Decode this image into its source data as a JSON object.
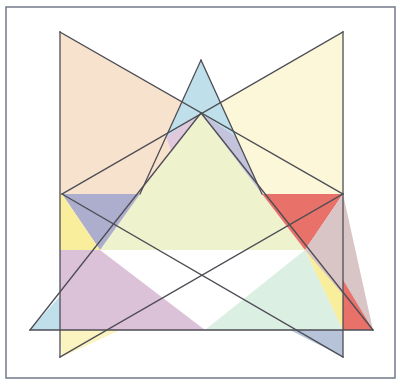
{
  "canvas": {
    "width": 404,
    "height": 387,
    "background": "#ffffff",
    "title": "Overlapping Translucent Triangles"
  },
  "frame": {
    "name": "border-frame",
    "x": 6,
    "y": 7,
    "width": 389,
    "height": 371,
    "stroke": "#7b8190",
    "stroke_width": 1.6,
    "fill": "#ffffff"
  },
  "style": {
    "outline_stroke": "#4d4d55",
    "outline_width": 1.3,
    "blend_mode": "multiply",
    "fill_opacity": 1
  },
  "palette": {
    "peach": "#f7e2cd",
    "pale_yellow": "#fbf7d8",
    "sky_blue": "#bfe0ea",
    "soft_green": "#e9f2cf",
    "mauve": "#dcc2d8",
    "blue_gray": "#adaece",
    "red": "#e8716a",
    "warm_yellow": "#f8ee9c",
    "mint": "#dcefe3",
    "rose_gray": "#d9c5c5"
  },
  "chart_data": {
    "type": "diagram",
    "subtype": "overlapping-triangles",
    "coordinate_space": {
      "x": [
        0,
        404
      ],
      "y": [
        0,
        387
      ],
      "origin": "top-left"
    },
    "shapes": [
      {
        "id": "triangle-peach",
        "label": "Peach left wedge",
        "fill": "#f7e2cd",
        "vertices": [
          [
            60,
            32
          ],
          [
            343,
            194
          ],
          [
            60,
            357
          ]
        ]
      },
      {
        "id": "triangle-pale-yellow",
        "label": "Pale yellow right wedge",
        "fill": "#fbf7d8",
        "vertices": [
          [
            343,
            32
          ],
          [
            62,
            194
          ],
          [
            343,
            357
          ]
        ]
      },
      {
        "id": "triangle-sky-blue",
        "label": "Sky blue narrow spire",
        "fill": "#bfe0ea",
        "vertices": [
          [
            201,
            60
          ],
          [
            262,
            194
          ],
          [
            140,
            194
          ]
        ]
      },
      {
        "id": "triangle-green-base",
        "label": "Soft green broad triangle",
        "fill": "#e9f2cf",
        "vertices": [
          [
            201,
            113
          ],
          [
            373,
            330
          ],
          [
            30,
            330
          ]
        ]
      }
    ],
    "overlap_regions": [
      {
        "label": "peach x pale-yellow upper",
        "tint": "#e8d4e0"
      },
      {
        "label": "peach x green left",
        "tint": "#adaece"
      },
      {
        "label": "pale-yellow x green center",
        "tint": "#eef3cd"
      },
      {
        "label": "green x peach lower",
        "tint": "#dcc2d8"
      },
      {
        "label": "pale-yellow outside green right",
        "tint": "#e8716a"
      },
      {
        "label": "warm yellow right lower",
        "tint": "#f8ee9c"
      },
      {
        "label": "mint bottom center",
        "tint": "#dcefe3"
      },
      {
        "label": "blue-gray bottom right",
        "tint": "#b6c3d8"
      }
    ],
    "counts": {
      "triangles": 4,
      "frame_rectangles": 1
    }
  },
  "regions": [
    {
      "name": "region-peach-upper-left",
      "fill": "#f7e2cd",
      "points": "60,32 201,113 140,194 62,194 60,194"
    },
    {
      "name": "region-pale-yellow-upper-right",
      "fill": "#fbf7d8",
      "points": "343,32 343,194 262,194 201,113"
    },
    {
      "name": "region-sky-blue-spire",
      "fill": "#bfe0ea",
      "points": "201,60 236,137 166,137"
    },
    {
      "name": "region-mauve-upper-left-overlap",
      "fill": "#e0c9dd",
      "points": "166,137 201,113 201,160 175,160"
    },
    {
      "name": "region-blue-gray-upper-right-overlap",
      "fill": "#c3c3db",
      "points": "236,137 262,194 201,160 201,113"
    },
    {
      "name": "region-center-soft-green",
      "fill": "#eef3cd",
      "points": "201,113 262,194 305,250 100,250 62,194 140,194"
    },
    {
      "name": "region-blue-gray-left",
      "fill": "#adaece",
      "points": "62,194 140,194 100,250"
    },
    {
      "name": "region-warm-yellow-left",
      "fill": "#f8ee9c",
      "points": "60,194 62,194 100,250 60,280"
    },
    {
      "name": "region-mauve-lower-left",
      "fill": "#dcc2d8",
      "points": "60,250 100,250 205,330 60,330"
    },
    {
      "name": "region-sky-blue-lower-left",
      "fill": "#bfe0ea",
      "points": "30,330 60,296 60,330"
    },
    {
      "name": "region-warm-yellow-lower-left-out",
      "fill": "#fbf3c0",
      "points": "60,330 62,357 120,330"
    },
    {
      "name": "region-mint-bottom",
      "fill": "#dcefe3",
      "points": "205,330 305,250 343,330"
    },
    {
      "name": "region-warm-yellow-right",
      "fill": "#f8ee9c",
      "points": "305,250 343,250 343,330"
    },
    {
      "name": "region-red-right",
      "fill": "#e8716a",
      "points": "262,194 343,194 305,250"
    },
    {
      "name": "region-rose-gray-right",
      "fill": "#d9c5c5",
      "points": "343,194 373,330 305,250"
    },
    {
      "name": "region-red-lower-right",
      "fill": "#e8716a",
      "points": "343,280 373,330 343,330"
    },
    {
      "name": "region-blue-gray-bottom-right",
      "fill": "#b6c3d8",
      "points": "343,330 343,357 290,330"
    }
  ],
  "lines": [
    {
      "name": "edge-peach-top",
      "from": [
        60,
        32
      ],
      "to": [
        343,
        194
      ]
    },
    {
      "name": "edge-peach-left",
      "from": [
        60,
        32
      ],
      "to": [
        60,
        357
      ]
    },
    {
      "name": "edge-peach-bottom",
      "from": [
        343,
        194
      ],
      "to": [
        60,
        357
      ]
    },
    {
      "name": "edge-yellow-top",
      "from": [
        343,
        32
      ],
      "to": [
        62,
        194
      ]
    },
    {
      "name": "edge-yellow-right",
      "from": [
        343,
        32
      ],
      "to": [
        343,
        357
      ]
    },
    {
      "name": "edge-yellow-bottom",
      "from": [
        62,
        194
      ],
      "to": [
        343,
        357
      ]
    },
    {
      "name": "edge-green-left",
      "from": [
        201,
        113
      ],
      "to": [
        30,
        330
      ]
    },
    {
      "name": "edge-green-right",
      "from": [
        201,
        113
      ],
      "to": [
        373,
        330
      ]
    },
    {
      "name": "edge-green-base",
      "from": [
        30,
        330
      ],
      "to": [
        373,
        330
      ]
    },
    {
      "name": "edge-spire-left",
      "from": [
        201,
        60
      ],
      "to": [
        140,
        194
      ]
    },
    {
      "name": "edge-spire-right",
      "from": [
        201,
        60
      ],
      "to": [
        262,
        194
      ]
    }
  ]
}
